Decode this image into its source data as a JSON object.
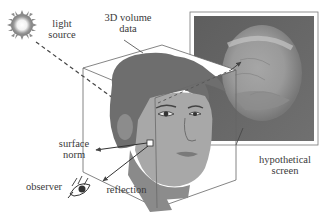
{
  "figure": {
    "type": "illustration",
    "labels": {
      "light_source": [
        "light",
        "source"
      ],
      "volume_data": [
        "3D volume",
        "data"
      ],
      "hypothetical_screen": [
        "hypothetical",
        "screen"
      ],
      "surface_norm": [
        "surface",
        "norm"
      ],
      "observer": "observer",
      "reflection": "reflection"
    },
    "colors": {
      "background": "#ffffff",
      "line": "#555555",
      "hair": "#6e6e6e",
      "skin": "#a8a8a8",
      "skin_shadow": "#8a8a8a",
      "screen_bg": "#6a6a6a",
      "brain": "#9a9a9a",
      "sun": "#8c8c8c"
    },
    "icons": [
      "sun-icon",
      "eye-icon"
    ]
  }
}
